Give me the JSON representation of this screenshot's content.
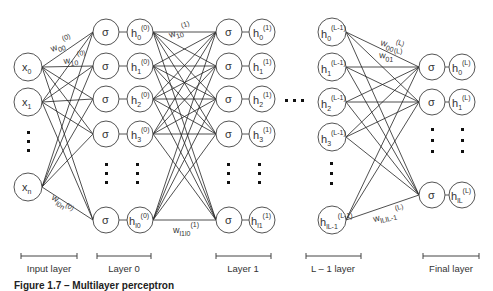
{
  "diagram": {
    "title": "Multilayer perceptron",
    "colors": {
      "stroke": "#555555",
      "edge": "#222222",
      "text": "#333333",
      "background": "#ffffff"
    },
    "input_layer": {
      "label": "Input layer",
      "nodes": [
        {
          "base": "x",
          "sub": "0"
        },
        {
          "base": "x",
          "sub": "1"
        },
        {
          "base": "x",
          "sub": "n"
        }
      ]
    },
    "layer0": {
      "label": "Layer 0",
      "activation": "σ",
      "nodes": [
        {
          "base": "h",
          "sub": "0",
          "sup": "(0)"
        },
        {
          "base": "h",
          "sub": "1",
          "sup": "(0)"
        },
        {
          "base": "h",
          "sub": "2",
          "sup": "(0)"
        },
        {
          "base": "h",
          "sub": "3",
          "sup": "(0)"
        },
        {
          "base": "h",
          "sub": "l0",
          "sup": "(0)"
        }
      ]
    },
    "layer1": {
      "label": "Layer 1",
      "activation": "σ",
      "nodes": [
        {
          "base": "h",
          "sub": "0",
          "sup": "(1)"
        },
        {
          "base": "h",
          "sub": "1",
          "sup": "(1)"
        },
        {
          "base": "h",
          "sub": "2",
          "sup": "(1)"
        },
        {
          "base": "h",
          "sub": "3",
          "sup": "(1)"
        },
        {
          "base": "h",
          "sub": "l1",
          "sup": "(1)"
        }
      ]
    },
    "layer_L_minus_1": {
      "label": "L – 1 layer",
      "nodes": [
        {
          "base": "h",
          "sub": "0",
          "sup": "(L-1)"
        },
        {
          "base": "h",
          "sub": "1",
          "sup": "(L-1)"
        },
        {
          "base": "h",
          "sub": "2",
          "sup": "(L-1)"
        },
        {
          "base": "h",
          "sub": "3",
          "sup": "(L-1)"
        },
        {
          "base": "h",
          "sub": "lL-1",
          "sup": "(L-1)"
        }
      ]
    },
    "final_layer": {
      "label": "Final layer",
      "activation": "σ",
      "nodes": [
        {
          "base": "h",
          "sub": "0",
          "sup": "(L)"
        },
        {
          "base": "h",
          "sub": "1",
          "sup": "(L)"
        },
        {
          "base": "h",
          "sub": "lL",
          "sup": "(L)"
        }
      ]
    },
    "weights": {
      "w00_0": {
        "base": "w",
        "sub": "00",
        "sup": "(0)"
      },
      "w10_0": {
        "base": "w",
        "sub": "10",
        "sup": "(0)"
      },
      "w1n_0": {
        "base": "w",
        "sub": "l0n",
        "sup": "(0)"
      },
      "w10_1": {
        "base": "w",
        "sub": "10",
        "sup": "(1)"
      },
      "w1110_1": {
        "base": "w",
        "sub": "l1l0",
        "sup": "(1)"
      },
      "w00_L": {
        "base": "w",
        "sub": "00",
        "sup": "(L)"
      },
      "w01_L": {
        "base": "w",
        "sub": "01",
        "sup": "(L)"
      },
      "wLL_L": {
        "base": "w",
        "sub": "lLlL-1",
        "sup": "(L)"
      }
    },
    "caption": "Figure 1.7 – Multilayer perceptron"
  }
}
